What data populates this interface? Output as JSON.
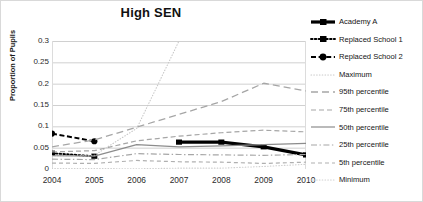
{
  "chart_data": {
    "type": "line",
    "title": "High SEN",
    "xlabel": "",
    "ylabel": "Proportion of Pupils",
    "x": [
      2004,
      2005,
      2006,
      2007,
      2008,
      2009,
      2010
    ],
    "xtick_labels": [
      "2004",
      "2005",
      "2006",
      "2007",
      "2008",
      "2009",
      "2010"
    ],
    "ytick_labels": [
      "0",
      "0.05",
      "0.1",
      "0.15",
      "0.2",
      "0.25",
      "0.3"
    ],
    "ytick_values": [
      0,
      0.05,
      0.1,
      0.15,
      0.2,
      0.25,
      0.3
    ],
    "ylim": [
      0,
      0.3
    ],
    "xlim": [
      2004,
      2010
    ],
    "grid": "horizontal",
    "legend_position": "right",
    "series": [
      {
        "name": "Academy A",
        "style": "solid-thick-square",
        "color": "#000000",
        "x": [
          2007,
          2008,
          2009,
          2010
        ],
        "values": [
          0.063,
          0.063,
          0.052,
          0.033
        ]
      },
      {
        "name": "Replaced School 1",
        "style": "dotted-square",
        "color": "#000000",
        "x": [
          2004,
          2005
        ],
        "values": [
          0.037,
          0.03
        ]
      },
      {
        "name": "Replaced School 2",
        "style": "dashed-circle",
        "color": "#000000",
        "x": [
          2004,
          2005
        ],
        "values": [
          0.083,
          0.065
        ]
      },
      {
        "name": "Maximum",
        "style": "fine-dotted",
        "color": "#c8c8c8",
        "x": [
          2004,
          2005,
          2006,
          2007,
          2008,
          2009,
          2010
        ],
        "values": [
          0.031,
          0.032,
          0.095,
          0.3,
          null,
          null,
          null
        ]
      },
      {
        "name": "95th percentile",
        "style": "long-dash",
        "color": "#a6a6a6",
        "x": [
          2004,
          2005,
          2006,
          2007,
          2008,
          2009,
          2010
        ],
        "values": [
          0.052,
          0.068,
          0.098,
          0.128,
          0.158,
          0.201,
          0.183
        ]
      },
      {
        "name": "75th percentile",
        "style": "medium-dash",
        "color": "#a6a6a6",
        "x": [
          2004,
          2005,
          2006,
          2007,
          2008,
          2009,
          2010
        ],
        "values": [
          0.04,
          0.043,
          0.066,
          0.077,
          0.085,
          0.091,
          0.087
        ]
      },
      {
        "name": "50th percentile",
        "style": "solid-thin",
        "color": "#8c8c8c",
        "x": [
          2004,
          2005,
          2006,
          2007,
          2008,
          2009,
          2010
        ],
        "values": [
          0.031,
          0.03,
          0.057,
          0.052,
          0.054,
          0.057,
          0.06
        ]
      },
      {
        "name": "25th  percentile",
        "style": "dash-dot",
        "color": "#a6a6a6",
        "x": [
          2004,
          2005,
          2006,
          2007,
          2008,
          2009,
          2010
        ],
        "values": [
          0.023,
          0.022,
          0.036,
          0.034,
          0.033,
          0.032,
          0.034
        ]
      },
      {
        "name": "5th percentile",
        "style": "short-dash",
        "color": "#b0b0b0",
        "x": [
          2004,
          2005,
          2006,
          2007,
          2008,
          2009,
          2010
        ],
        "values": [
          0.014,
          0.013,
          0.02,
          0.017,
          0.016,
          0.013,
          0.016
        ]
      },
      {
        "name": "Minimum",
        "style": "fine-dotted",
        "color": "#cfcfcf",
        "x": [
          2004,
          2005,
          2006,
          2007,
          2008,
          2009,
          2010
        ],
        "values": [
          0.001,
          0.001,
          0.0005,
          0.002,
          0.002,
          0.006,
          0.011
        ]
      }
    ]
  },
  "legend": {
    "items": [
      {
        "label": "Academy A"
      },
      {
        "label": "Replaced School 1"
      },
      {
        "label": "Replaced School 2"
      },
      {
        "label": "Maximum"
      },
      {
        "label": "95th percentile"
      },
      {
        "label": "75th percentile"
      },
      {
        "label": "50th percentile"
      },
      {
        "label": "25th  percentile"
      },
      {
        "label": "5th percentile"
      },
      {
        "label": "Minimum"
      }
    ]
  },
  "colors": {
    "series_dark": "#000000",
    "reference_gray": "#a6a6a6",
    "gridline": "#d0d0d0",
    "text": "#1a1a1a",
    "background": "#ffffff"
  }
}
